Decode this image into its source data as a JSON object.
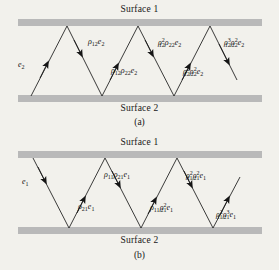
{
  "figure": {
    "panels": [
      {
        "id": "a",
        "caption": "(a)",
        "surface_top_label": "Surface 1",
        "surface_bottom_label": "Surface 2",
        "incident_label": "e2",
        "labels_upper": [
          "ρ₁₂e₂",
          "ρ²₁₂ρ₂₂e₂",
          "ρ³₁₂ρ²₂₂e₂"
        ],
        "labels_lower": [
          "ρ₁₂ρ₂₂e₂",
          "ρ²₁₂ρ²₂₂e₂"
        ]
      },
      {
        "id": "b",
        "caption": "(b)",
        "surface_top_label": "Surface 1",
        "surface_bottom_label": "Surface 2",
        "incident_label": "e1",
        "labels_upper": [
          "ρ₁₁ρ₂₁e₁",
          "ρ²₁₁ρ²₂₁e₁"
        ],
        "labels_lower": [
          "ρ₂₁e₁",
          "ρ₁₁ρ²₂₁e₁",
          "ρ²₁₁ρ³₂₁e₁"
        ]
      }
    ],
    "colors": {
      "background": "#f2f1ec",
      "surface_band": "#b9b9b9",
      "ray": "#1a1a1a",
      "text": "#141414"
    }
  }
}
